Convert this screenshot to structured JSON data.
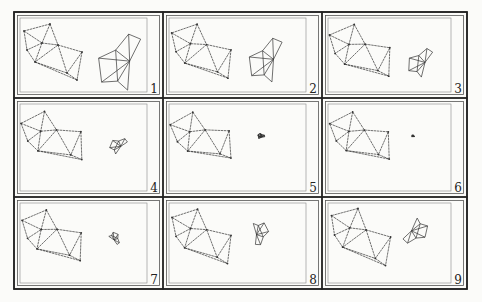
{
  "figure": {
    "stroke_color": "#333333",
    "background": "#fbfbf9",
    "frame": {
      "x": 14,
      "y": 12,
      "w": 453,
      "h": 277
    },
    "col_edges": [
      14,
      163,
      322,
      467
    ],
    "row_edges": [
      12,
      98,
      197,
      289
    ],
    "left_mesh": {
      "vertices": [
        [
          24,
          31
        ],
        [
          50,
          24
        ],
        [
          42,
          43
        ],
        [
          58,
          45
        ],
        [
          27,
          50
        ],
        [
          35,
          62
        ],
        [
          82,
          52
        ],
        [
          67,
          73
        ],
        [
          77,
          80
        ]
      ],
      "edges": [
        [
          0,
          1
        ],
        [
          0,
          2
        ],
        [
          1,
          2
        ],
        [
          1,
          3
        ],
        [
          2,
          3
        ],
        [
          0,
          4
        ],
        [
          2,
          4
        ],
        [
          4,
          5
        ],
        [
          2,
          5
        ],
        [
          3,
          5
        ],
        [
          3,
          6
        ],
        [
          5,
          7
        ],
        [
          3,
          7
        ],
        [
          6,
          7
        ],
        [
          6,
          8
        ],
        [
          7,
          8
        ],
        [
          5,
          8
        ]
      ]
    },
    "panels": [
      {
        "label": "1",
        "right_scale": 1.0,
        "right_rot": 0,
        "left_rot": 0,
        "left_scale": 1.0,
        "right_center": [
          120,
          62
        ]
      },
      {
        "label": "2",
        "right_scale": 0.78,
        "right_rot": 0,
        "left_rot": -4,
        "left_scale": 1.0,
        "right_center": [
          117,
          60
        ]
      },
      {
        "label": "3",
        "right_scale": 0.52,
        "right_rot": 10,
        "left_rot": -8,
        "left_scale": 1.0,
        "right_center": [
          112,
          62
        ]
      },
      {
        "label": "4",
        "right_scale": 0.32,
        "right_rot": 30,
        "left_rot": -12,
        "left_scale": 0.98,
        "right_center": [
          118,
          59
        ]
      },
      {
        "label": "5",
        "right_scale": 0.12,
        "right_rot": 60,
        "left_rot": -14,
        "left_scale": 0.96,
        "right_center": [
          112,
          50
        ]
      },
      {
        "label": "6",
        "right_scale": 0.05,
        "right_rot": 80,
        "left_rot": -12,
        "left_scale": 0.96,
        "right_center": [
          105,
          50
        ]
      },
      {
        "label": "7",
        "right_scale": 0.22,
        "right_rot": 120,
        "left_rot": -8,
        "left_scale": 0.98,
        "right_center": [
          115,
          53
        ]
      },
      {
        "label": "8",
        "right_scale": 0.4,
        "right_rot": 160,
        "left_rot": -3,
        "left_scale": 1.0,
        "right_center": [
          111,
          48
        ]
      },
      {
        "label": "9",
        "right_scale": 0.48,
        "right_rot": 200,
        "left_rot": 0,
        "left_scale": 1.02,
        "right_center": [
          108,
          47
        ]
      }
    ],
    "right_mesh": {
      "vertices": [
        [
          128,
          35
        ],
        [
          140,
          40
        ],
        [
          115,
          51
        ],
        [
          129,
          62
        ],
        [
          98,
          59
        ],
        [
          101,
          83
        ],
        [
          117,
          82
        ],
        [
          127,
          91
        ]
      ],
      "edges": [
        [
          0,
          1
        ],
        [
          0,
          2
        ],
        [
          0,
          3
        ],
        [
          1,
          3
        ],
        [
          2,
          3
        ],
        [
          2,
          4
        ],
        [
          4,
          3
        ],
        [
          2,
          6
        ],
        [
          4,
          5
        ],
        [
          5,
          3
        ],
        [
          6,
          3
        ],
        [
          6,
          7
        ],
        [
          7,
          3
        ],
        [
          5,
          6
        ]
      ]
    }
  }
}
